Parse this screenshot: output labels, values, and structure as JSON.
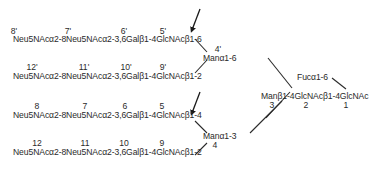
{
  "branches": {
    "upper_a": {
      "chain": "Neu5NAcα2-8Neu5NAcα2-3,6Galβ1-4GlcNAcβ1-6",
      "numbers": [
        "8'",
        "7'",
        "6'",
        "5'"
      ]
    },
    "upper_b": {
      "chain": "Neu5NAcα2-8Neu5NAcα2-3,6Galβ1-4GlcNAcβ1-2",
      "numbers": [
        "12'",
        "11'",
        "10'",
        "9'"
      ]
    },
    "lower_a": {
      "chain": "Neu5NAcα2-8Neu5NAcα2-3,6Galβ1-4GlcNAcβ1-4",
      "numbers": [
        "8",
        "7",
        "6",
        "5"
      ]
    },
    "lower_b": {
      "chain": "Neu5NAcα2-8Neu5NAcα2-3,6Galβ1-4GlcNAcβ1-2",
      "numbers": [
        "12",
        "11",
        "10",
        "9"
      ]
    }
  },
  "mannose_upper": {
    "label": "Manα1-6",
    "number": "4'"
  },
  "mannose_lower": {
    "label": "Manα1-3",
    "number": "4"
  },
  "core": {
    "chain": "Manβ1-4GlcNAcβ1-4GlcNAc",
    "numbers": [
      "3",
      "2",
      "1"
    ]
  },
  "fucose": {
    "label": "Fucα1-6"
  },
  "arrows": [
    "arrow-upper-branch-5prime",
    "arrow-lower-branch-5"
  ],
  "colors": {
    "ink": "#2a2a2a",
    "background": "#ffffff"
  }
}
